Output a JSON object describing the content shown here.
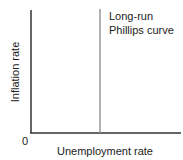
{
  "chart_data": {
    "type": "line",
    "title": "",
    "xlabel": "Unemployment rate",
    "ylabel": "Inflation rate",
    "origin_label": "0",
    "xlim": [
      0,
      1
    ],
    "ylim": [
      0,
      1
    ],
    "grid": false,
    "series": [
      {
        "name": "Long-run Phillips curve",
        "label_lines": [
          "Long-run",
          "Phillips curve"
        ],
        "kind": "vertical",
        "x": 0.46,
        "color": "#999999"
      }
    ],
    "axis_color": "#333333"
  }
}
